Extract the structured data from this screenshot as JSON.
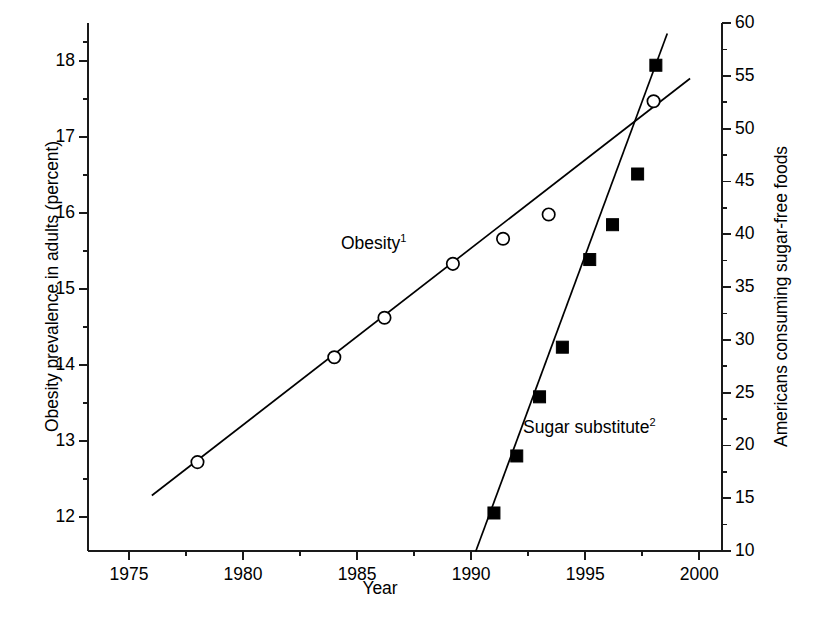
{
  "chart_data": {
    "type": "line",
    "title": "",
    "xlabel": "Year",
    "ylabel_left": "Obesity prevalence in adults (percent)",
    "ylabel_right": "Americans consuming sugar-free foods",
    "xlim": [
      1973.2,
      2001.0
    ],
    "xticks": [
      1975,
      1980,
      1985,
      1990,
      1995,
      2000
    ],
    "xticklabels": [
      "1975",
      "1980",
      "1985",
      "1990",
      "1995",
      "2000"
    ],
    "xminorticks": [
      1977.5,
      1982.5,
      1987.5,
      1992.5,
      1997.5
    ],
    "ylim_left": [
      11.55,
      18.5
    ],
    "yticks_left": [
      12,
      13,
      14,
      15,
      16,
      17,
      18
    ],
    "yticklabels_left": [
      "12",
      "13",
      "14",
      "15",
      "16",
      "17",
      "18"
    ],
    "yminorticks_left": [
      12.5,
      13.5,
      14.5,
      15.5,
      16.5,
      17.5,
      18.25
    ],
    "ylim_right": [
      10,
      60
    ],
    "yticks_right": [
      10,
      15,
      20,
      25,
      30,
      35,
      40,
      45,
      50,
      55,
      60
    ],
    "yticklabels_right": [
      "10",
      "15",
      "20",
      "25",
      "30",
      "35",
      "40",
      "45",
      "50",
      "55",
      "60"
    ],
    "yminorticks_right": [
      12.5,
      17.5,
      22.5,
      27.5,
      32.5,
      37.5,
      42.5,
      47.5,
      52.5,
      57.5
    ],
    "grid": false,
    "legend_position": "inline-annotation",
    "series": [
      {
        "name": "Obesity",
        "label": "Obesity",
        "label_superscript": "1",
        "axis": "left",
        "marker": "open-circle",
        "marker_color": "#ffffff",
        "marker_edge_color": "#000000",
        "line_color": "#000000",
        "points": [
          {
            "x": 1978.0,
            "y": 12.72
          },
          {
            "x": 1984.0,
            "y": 14.1
          },
          {
            "x": 1986.2,
            "y": 14.62
          },
          {
            "x": 1989.2,
            "y": 15.33
          },
          {
            "x": 1991.4,
            "y": 15.66
          },
          {
            "x": 1993.4,
            "y": 15.98
          },
          {
            "x": 1998.0,
            "y": 17.47
          }
        ],
        "trendline": [
          {
            "x": 1976.0,
            "y": 12.28
          },
          {
            "x": 1999.6,
            "y": 17.77
          }
        ]
      },
      {
        "name": "Sugar substitute",
        "label": "Sugar substitute",
        "label_superscript": "2",
        "axis": "right",
        "marker": "filled-square",
        "marker_color": "#000000",
        "marker_edge_color": "#000000",
        "line_color": "#000000",
        "points": [
          {
            "x": 1991.0,
            "y": 13.6
          },
          {
            "x": 1992.0,
            "y": 19.0
          },
          {
            "x": 1993.0,
            "y": 24.6
          },
          {
            "x": 1994.0,
            "y": 29.3
          },
          {
            "x": 1995.2,
            "y": 37.6
          },
          {
            "x": 1996.2,
            "y": 40.9
          },
          {
            "x": 1997.3,
            "y": 45.7
          },
          {
            "x": 1998.1,
            "y": 56.0
          }
        ],
        "trendline": [
          {
            "x": 1990.2,
            "y": 9.95
          },
          {
            "x": 1998.6,
            "y": 59.0
          }
        ]
      }
    ]
  },
  "axis_titles": {
    "left": "Obesity prevalence in adults (percent)",
    "right": "Americans consuming sugar-free foods",
    "bottom": "Year"
  },
  "annotations": {
    "obesity": "Obesity",
    "obesity_sup": "1",
    "sugar": "Sugar substitute",
    "sugar_sup": "2"
  },
  "colors": {
    "background": "#ffffff",
    "foreground": "#000000",
    "axis": "#1a1a1a"
  }
}
